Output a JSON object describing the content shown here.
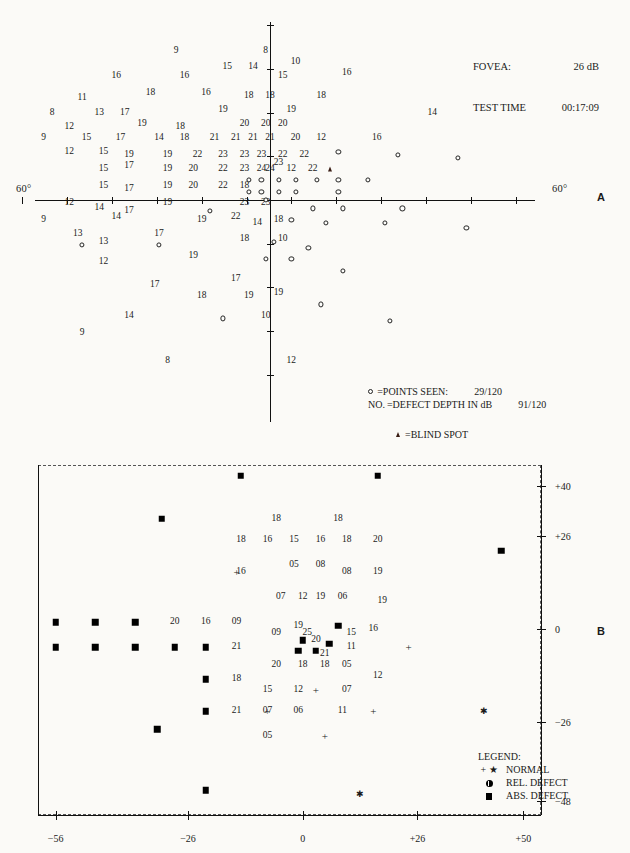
{
  "header": {
    "fovea_label": "FOVEA:",
    "fovea_value": "26 dB",
    "test_time_label": "TEST TIME",
    "test_time_value": "00:17:09"
  },
  "panelA": {
    "letter": "A",
    "axis_left_label": "60°",
    "axis_right_label": "60°",
    "legend": {
      "points_seen_label": "=POINTS SEEN:",
      "points_seen_value": "29/120",
      "defect_depth_prefix": "NO.",
      "defect_depth_label": "=DEFECT DEPTH IN dB",
      "defect_depth_value": "91/120",
      "blind_spot_label": "=BLIND SPOT"
    },
    "chart_data": {
      "type": "scatter",
      "title": "Visual field sensitivity (dB) — numeric plot",
      "xlabel": "",
      "ylabel": "",
      "xlim": [
        -60,
        60
      ],
      "ylim": [
        -60,
        60
      ],
      "grid": false,
      "notes": "Numbers are sensitivity in dB; small open circles are points seen; triangle is blind spot.",
      "values": [
        {
          "x": -22,
          "y": 53,
          "v": "9"
        },
        {
          "x": -1,
          "y": 53,
          "v": "8"
        },
        {
          "x": 6,
          "y": 49,
          "v": "10"
        },
        {
          "x": -36,
          "y": 44,
          "v": "16"
        },
        {
          "x": -20,
          "y": 44,
          "v": "16"
        },
        {
          "x": -10,
          "y": 47,
          "v": "15"
        },
        {
          "x": -4,
          "y": 47,
          "v": "14"
        },
        {
          "x": 3,
          "y": 44,
          "v": "15"
        },
        {
          "x": 18,
          "y": 45,
          "v": "16"
        },
        {
          "x": -44,
          "y": 36,
          "v": "11"
        },
        {
          "x": -28,
          "y": 38,
          "v": "18"
        },
        {
          "x": -15,
          "y": 38,
          "v": "16"
        },
        {
          "x": -5,
          "y": 37,
          "v": "18"
        },
        {
          "x": 0,
          "y": 37,
          "v": "18"
        },
        {
          "x": 12,
          "y": 37,
          "v": "18"
        },
        {
          "x": -51,
          "y": 31,
          "v": "8"
        },
        {
          "x": -40,
          "y": 31,
          "v": "13"
        },
        {
          "x": -34,
          "y": 31,
          "v": "17"
        },
        {
          "x": -11,
          "y": 32,
          "v": "19"
        },
        {
          "x": 5,
          "y": 32,
          "v": "19"
        },
        {
          "x": 38,
          "y": 31,
          "v": "14"
        },
        {
          "x": -47,
          "y": 26,
          "v": "12"
        },
        {
          "x": -30,
          "y": 27,
          "v": "19"
        },
        {
          "x": -21,
          "y": 26,
          "v": "18"
        },
        {
          "x": -6,
          "y": 27,
          "v": "20"
        },
        {
          "x": -1,
          "y": 27,
          "v": "20"
        },
        {
          "x": 3,
          "y": 27,
          "v": "20"
        },
        {
          "x": -53,
          "y": 22,
          "v": "9"
        },
        {
          "x": -43,
          "y": 22,
          "v": "15"
        },
        {
          "x": -35,
          "y": 22,
          "v": "17"
        },
        {
          "x": -26,
          "y": 22,
          "v": "14"
        },
        {
          "x": -20,
          "y": 22,
          "v": "18"
        },
        {
          "x": -13,
          "y": 22,
          "v": "21"
        },
        {
          "x": -8,
          "y": 22,
          "v": "21"
        },
        {
          "x": -4,
          "y": 22,
          "v": "21"
        },
        {
          "x": 0,
          "y": 22,
          "v": "21"
        },
        {
          "x": 6,
          "y": 22,
          "v": "20"
        },
        {
          "x": 12,
          "y": 22,
          "v": "12"
        },
        {
          "x": 25,
          "y": 22,
          "v": "16"
        },
        {
          "x": -47,
          "y": 17,
          "v": "12"
        },
        {
          "x": -39,
          "y": 17,
          "v": "15"
        },
        {
          "x": -33,
          "y": 16,
          "v": "19"
        },
        {
          "x": -24,
          "y": 16,
          "v": "19"
        },
        {
          "x": -17,
          "y": 16,
          "v": "22"
        },
        {
          "x": -11,
          "y": 16,
          "v": "23"
        },
        {
          "x": -6,
          "y": 16,
          "v": "23"
        },
        {
          "x": -2,
          "y": 16,
          "v": "23"
        },
        {
          "x": 3,
          "y": 16,
          "v": "22"
        },
        {
          "x": 8,
          "y": 16,
          "v": "22"
        },
        {
          "x": -39,
          "y": 11,
          "v": "15"
        },
        {
          "x": -33,
          "y": 12,
          "v": "17"
        },
        {
          "x": -24,
          "y": 11,
          "v": "19"
        },
        {
          "x": -18,
          "y": 11,
          "v": "20"
        },
        {
          "x": -11,
          "y": 11,
          "v": "22"
        },
        {
          "x": -6,
          "y": 11,
          "v": "23"
        },
        {
          "x": -2,
          "y": 11,
          "v": "24"
        },
        {
          "x": 0,
          "y": 11,
          "v": "24"
        },
        {
          "x": 2,
          "y": 13,
          "v": "23"
        },
        {
          "x": 5,
          "y": 11,
          "v": "12"
        },
        {
          "x": 10,
          "y": 11,
          "v": "22"
        },
        {
          "x": -39,
          "y": 5,
          "v": "15"
        },
        {
          "x": -33,
          "y": 4,
          "v": "17"
        },
        {
          "x": -24,
          "y": 5,
          "v": "19"
        },
        {
          "x": -18,
          "y": 5,
          "v": "20"
        },
        {
          "x": -11,
          "y": 5,
          "v": "22"
        },
        {
          "x": -6,
          "y": 5,
          "v": "18"
        },
        {
          "x": -47,
          "y": -1,
          "v": "12"
        },
        {
          "x": -40,
          "y": -3,
          "v": "14"
        },
        {
          "x": -33,
          "y": -4,
          "v": "17"
        },
        {
          "x": -24,
          "y": -1,
          "v": "19"
        },
        {
          "x": -6,
          "y": -1,
          "v": "23"
        },
        {
          "x": -1,
          "y": -1,
          "v": "23"
        },
        {
          "x": -53,
          "y": -7,
          "v": "9"
        },
        {
          "x": -36,
          "y": -6,
          "v": "14"
        },
        {
          "x": -16,
          "y": -7,
          "v": "19"
        },
        {
          "x": -8,
          "y": -6,
          "v": "22"
        },
        {
          "x": -3,
          "y": -8,
          "v": "14"
        },
        {
          "x": 2,
          "y": -7,
          "v": "18"
        },
        {
          "x": -45,
          "y": -12,
          "v": "13"
        },
        {
          "x": -39,
          "y": -15,
          "v": "13"
        },
        {
          "x": -26,
          "y": -12,
          "v": "17"
        },
        {
          "x": -6,
          "y": -14,
          "v": "18"
        },
        {
          "x": 3,
          "y": -14,
          "v": "10"
        },
        {
          "x": -39,
          "y": -22,
          "v": "12"
        },
        {
          "x": -18,
          "y": -20,
          "v": "19"
        },
        {
          "x": -27,
          "y": -30,
          "v": "17"
        },
        {
          "x": -8,
          "y": -28,
          "v": "17"
        },
        {
          "x": -16,
          "y": -34,
          "v": "18"
        },
        {
          "x": -5,
          "y": -34,
          "v": "19"
        },
        {
          "x": 2,
          "y": -33,
          "v": "19"
        },
        {
          "x": -33,
          "y": -41,
          "v": "14"
        },
        {
          "x": -1,
          "y": -41,
          "v": "10"
        },
        {
          "x": -44,
          "y": -47,
          "v": "9"
        },
        {
          "x": -24,
          "y": -57,
          "v": "8"
        },
        {
          "x": 5,
          "y": -57,
          "v": "12"
        }
      ],
      "seen_points": [
        {
          "x": 16,
          "y": 17
        },
        {
          "x": 30,
          "y": 16
        },
        {
          "x": 44,
          "y": 15
        },
        {
          "x": -5,
          "y": 7
        },
        {
          "x": -2,
          "y": 7
        },
        {
          "x": 2,
          "y": 7
        },
        {
          "x": 6,
          "y": 7
        },
        {
          "x": 11,
          "y": 7
        },
        {
          "x": 16,
          "y": 7
        },
        {
          "x": 23,
          "y": 7
        },
        {
          "x": -5,
          "y": 3
        },
        {
          "x": -2,
          "y": 3
        },
        {
          "x": 2,
          "y": 3
        },
        {
          "x": 6,
          "y": 3
        },
        {
          "x": 16,
          "y": 3
        },
        {
          "x": -1,
          "y": 0
        },
        {
          "x": -14,
          "y": -4
        },
        {
          "x": 10,
          "y": -3
        },
        {
          "x": 17,
          "y": -3
        },
        {
          "x": 31,
          "y": -3
        },
        {
          "x": 5,
          "y": -7
        },
        {
          "x": 13,
          "y": -8
        },
        {
          "x": 27,
          "y": -8
        },
        {
          "x": 46,
          "y": -10
        },
        {
          "x": -44,
          "y": -16
        },
        {
          "x": -26,
          "y": -16
        },
        {
          "x": 1,
          "y": -15
        },
        {
          "x": 9,
          "y": -17
        },
        {
          "x": -1,
          "y": -21
        },
        {
          "x": 5,
          "y": -21
        },
        {
          "x": 17,
          "y": -25
        },
        {
          "x": 12,
          "y": -37
        },
        {
          "x": 28,
          "y": -43
        },
        {
          "x": -11,
          "y": -42
        }
      ],
      "blind_spot": {
        "x": 14,
        "y": 11
      }
    }
  },
  "panelB": {
    "letter": "B",
    "x_ticks": [
      "−56",
      "−26",
      "0",
      "+26",
      "+50"
    ],
    "y_ticks": [
      "+40",
      "+26",
      "0",
      "−26",
      "−48"
    ],
    "legend": {
      "title": "LEGEND:",
      "items": [
        {
          "symbol": "+ *",
          "label": "NORMAL"
        },
        {
          "symbol": "rel-defect",
          "label": "REL. DEFECT"
        },
        {
          "symbol": "abs-defect",
          "label": "ABS. DEFECT"
        }
      ]
    },
    "chart_data": {
      "type": "scatter",
      "title": "Defect depth plot",
      "xlabel": "",
      "ylabel": "",
      "xlim": [
        -60,
        54
      ],
      "ylim": [
        -52,
        46
      ],
      "grid": false,
      "notes": "Filled squares = absolute defect; + and * = normal; two-digit numbers = defect depth in dB.",
      "squares": [
        {
          "x": -14,
          "y": 43
        },
        {
          "x": 17,
          "y": 43
        },
        {
          "x": -32,
          "y": 31
        },
        {
          "x": 45,
          "y": 22
        },
        {
          "x": -56,
          "y": 2
        },
        {
          "x": -47,
          "y": 2
        },
        {
          "x": -38,
          "y": 2
        },
        {
          "x": 8,
          "y": 1
        },
        {
          "x": -56,
          "y": -5
        },
        {
          "x": -47,
          "y": -5
        },
        {
          "x": -38,
          "y": -5
        },
        {
          "x": -29,
          "y": -5
        },
        {
          "x": -22,
          "y": -5
        },
        {
          "x": 0,
          "y": -3
        },
        {
          "x": 3,
          "y": -6
        },
        {
          "x": 6,
          "y": -4
        },
        {
          "x": -1,
          "y": -6
        },
        {
          "x": -22,
          "y": -14
        },
        {
          "x": -22,
          "y": -23
        },
        {
          "x": -33,
          "y": -28
        },
        {
          "x": -22,
          "y": -45
        }
      ],
      "pluses": [
        {
          "x": -15,
          "y": 16
        },
        {
          "x": 24,
          "y": -5
        },
        {
          "x": 3,
          "y": -17
        },
        {
          "x": 16,
          "y": -23
        },
        {
          "x": -8,
          "y": -23
        },
        {
          "x": 5,
          "y": -30
        }
      ],
      "stars": [
        {
          "x": 41,
          "y": -23
        },
        {
          "x": 13,
          "y": -46
        }
      ],
      "values": [
        {
          "x": -6,
          "y": 31,
          "v": "18"
        },
        {
          "x": 8,
          "y": 31,
          "v": "18"
        },
        {
          "x": -14,
          "y": 25,
          "v": "18"
        },
        {
          "x": -8,
          "y": 25,
          "v": "16"
        },
        {
          "x": -2,
          "y": 25,
          "v": "15"
        },
        {
          "x": 4,
          "y": 25,
          "v": "16"
        },
        {
          "x": 10,
          "y": 25,
          "v": "18"
        },
        {
          "x": 17,
          "y": 25,
          "v": "20"
        },
        {
          "x": -15,
          "y": 16,
          "v": ""
        },
        {
          "x": -14,
          "y": 16,
          "v": "16"
        },
        {
          "x": -2,
          "y": 18,
          "v": "05"
        },
        {
          "x": 4,
          "y": 18,
          "v": "08"
        },
        {
          "x": 10,
          "y": 16,
          "v": "08"
        },
        {
          "x": 17,
          "y": 16,
          "v": "19"
        },
        {
          "x": -5,
          "y": 9,
          "v": "07"
        },
        {
          "x": 0,
          "y": 9,
          "v": "12"
        },
        {
          "x": 4,
          "y": 9,
          "v": "19"
        },
        {
          "x": 9,
          "y": 9,
          "v": "06"
        },
        {
          "x": 18,
          "y": 8,
          "v": "19"
        },
        {
          "x": -29,
          "y": 2,
          "v": "20"
        },
        {
          "x": -22,
          "y": 2,
          "v": "16"
        },
        {
          "x": -15,
          "y": 2,
          "v": "09"
        },
        {
          "x": -6,
          "y": -1,
          "v": "09"
        },
        {
          "x": -1,
          "y": 1,
          "v": "19"
        },
        {
          "x": 1,
          "y": -1,
          "v": "25"
        },
        {
          "x": 11,
          "y": -1,
          "v": "15"
        },
        {
          "x": 16,
          "y": 0,
          "v": "16"
        },
        {
          "x": 3,
          "y": -3,
          "v": "20"
        },
        {
          "x": -15,
          "y": -5,
          "v": "21"
        },
        {
          "x": 5,
          "y": -7,
          "v": "21"
        },
        {
          "x": 11,
          "y": -5,
          "v": "11"
        },
        {
          "x": -6,
          "y": -10,
          "v": "20"
        },
        {
          "x": 0,
          "y": -10,
          "v": "18"
        },
        {
          "x": 5,
          "y": -10,
          "v": "18"
        },
        {
          "x": 10,
          "y": -10,
          "v": "05"
        },
        {
          "x": -15,
          "y": -14,
          "v": "18"
        },
        {
          "x": 17,
          "y": -13,
          "v": "12"
        },
        {
          "x": -8,
          "y": -17,
          "v": "15"
        },
        {
          "x": -1,
          "y": -17,
          "v": "12"
        },
        {
          "x": 10,
          "y": -17,
          "v": "07"
        },
        {
          "x": -15,
          "y": -23,
          "v": "21"
        },
        {
          "x": -8,
          "y": -23,
          "v": "07"
        },
        {
          "x": -1,
          "y": -23,
          "v": "06"
        },
        {
          "x": 9,
          "y": -23,
          "v": "11"
        },
        {
          "x": -8,
          "y": -30,
          "v": "05"
        }
      ]
    }
  }
}
